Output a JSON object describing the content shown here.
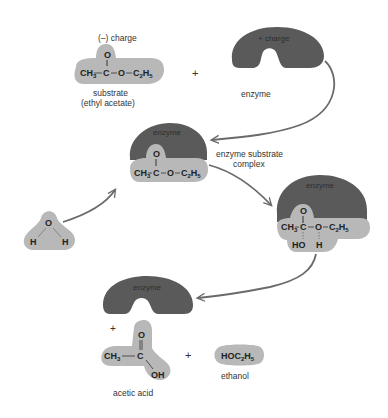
{
  "colors": {
    "enzyme": "#5a5a5a",
    "molecule": "#b8b8b8",
    "arrow": "#6a6a6a",
    "text": "#333333",
    "background": "#ffffff"
  },
  "substrate": {
    "charge_label": "(–) charge",
    "formula": {
      "left": "CH",
      "left_sub": "3",
      "c": "C",
      "o_top": "O",
      "o": "O",
      "right": "C",
      "right_sub1": "2",
      "right_h": "H",
      "right_sub2": "5"
    },
    "name": "substrate",
    "name2": "(ethyl acetate)"
  },
  "plus_top": "+",
  "enzyme_top": {
    "charge_label": "+ charge",
    "name": "enzyme"
  },
  "complex": {
    "enzyme_label": "enzyme",
    "formula": {
      "left": "CH",
      "left_sub": "3",
      "c": "C",
      "o_top": "O",
      "o": "O",
      "right": "C",
      "right_sub1": "2",
      "right_h": "H",
      "right_sub2": "5"
    },
    "name": "enzyme substrate",
    "name2": "complex"
  },
  "water": {
    "o": "O",
    "h1": "H",
    "h2": "H"
  },
  "intermediate": {
    "enzyme_label": "enzyme",
    "formula": {
      "left": "CH",
      "left_sub": "3",
      "c": "C",
      "o_top": "O",
      "o": "O",
      "right": "C",
      "right_sub1": "2",
      "right_h": "H",
      "right_sub2": "5",
      "ho": "HO",
      "h": "H"
    }
  },
  "products": {
    "enzyme_label": "enzyme",
    "plus_left": "+",
    "acetic_acid": {
      "o_top": "O",
      "left": "CH",
      "left_sub": "3",
      "c": "C",
      "oh": "OH",
      "name": "acetic acid"
    },
    "plus_mid": "+",
    "ethanol": {
      "formula_a": "HOC",
      "sub1": "2",
      "formula_b": "H",
      "sub2": "5",
      "name": "ethanol"
    }
  }
}
